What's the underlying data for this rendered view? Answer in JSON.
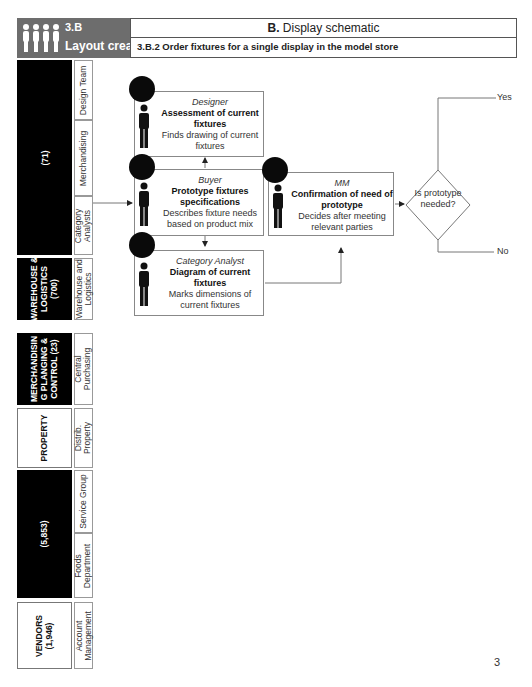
{
  "header": {
    "section_number": "3.B",
    "section_title": "Layout creation",
    "schematic_prefix": "B.",
    "schematic_title": "Display schematic",
    "step_title": "3.B.2  Order fixtures for a single display in the model store",
    "icon": "people-group-icon"
  },
  "lanes": [
    {
      "label": "(71)",
      "style": "black",
      "sublanes": [
        "Design Team",
        "Merchandising",
        "Category Analysts"
      ]
    },
    {
      "label": "WAREHOUSE & LOGISTICS (700)",
      "style": "black",
      "sublanes": [
        "Warehouse and Logistics"
      ]
    },
    {
      "label": "MERCHANDISING PLANGING & CONTROL (23)",
      "style": "black",
      "sublanes": [
        "Central Purchasing"
      ]
    },
    {
      "label": "PROPERTY",
      "style": "white",
      "sublanes": [
        "Distrib. Property"
      ]
    },
    {
      "label": "(5,853)",
      "style": "black",
      "sublanes": [
        "Service Group",
        "Foods Department"
      ]
    },
    {
      "label": "VENDORS (1,946)",
      "style": "white",
      "sublanes": [
        "Account Management"
      ]
    }
  ],
  "lane_text": {
    "l0": "(71)",
    "l1a": "WAREHOUSE &",
    "l1b": "LOGISTICS",
    "l1c": "(700)",
    "l2a": "MERCHANDISIN",
    "l2b": "G PLANGING &",
    "l2c": "CONTROL (23)",
    "l3": "PROPERTY",
    "l4": "(5,853)",
    "l5a": "VENDORS",
    "l5b": "(1,946)",
    "s_design": "Design Team",
    "s_merch": "Merchandising",
    "s_cat_a": "Category",
    "s_cat_b": "Analysts",
    "s_wh_a": "Warehouse and",
    "s_wh_b": "Logistics",
    "s_cp_a": "Central",
    "s_cp_b": "Purchasing",
    "s_dp_a": "Distrib.",
    "s_dp_b": "Property",
    "s_sg": "Service Group",
    "s_fd_a": "Foods",
    "s_fd_b": "Department",
    "s_am_a": "Account",
    "s_am_b": "Management"
  },
  "tasks": [
    {
      "role": "Designer",
      "name": "Assessment of current fixtures",
      "desc": "Finds drawing of current fixtures"
    },
    {
      "role": "Buyer",
      "name": "Prototype fixtures specifications",
      "desc": "Describes fixture needs based on product mix"
    },
    {
      "role": "Category Analyst",
      "name": "Diagram of current fixtures",
      "desc": "Marks dimensions of current fixtures"
    },
    {
      "role": "MM",
      "name": "Confirmation of need of prototype",
      "desc": "Decides after meeting relevant parties"
    }
  ],
  "decision": {
    "question": "Is prototype needed?",
    "yes_label": "Yes",
    "no_label": "No"
  },
  "page_number": "3",
  "colors": {
    "header_grey": "#6d6d6d",
    "lane_black": "#000000",
    "line": "#777777"
  }
}
